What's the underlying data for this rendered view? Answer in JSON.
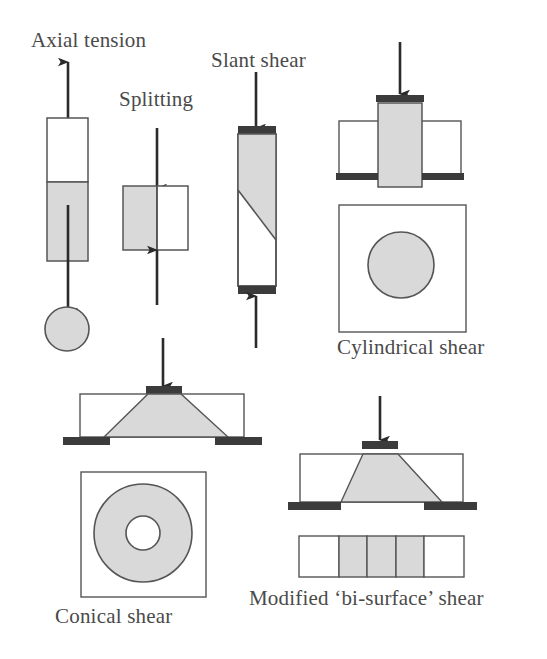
{
  "figure": {
    "background_color": "#ffffff",
    "line_color": "#555555",
    "shade_color": "#d9d9d9",
    "plate_color": "#3b3b3b",
    "text_color": "#4a4a4a",
    "arrow_color": "#2b2b2b"
  },
  "labels": {
    "axial_tension": "Axial tension",
    "splitting": "Splitting",
    "slant_shear": "Slant shear",
    "cylindrical_shear": "Cylindrical shear",
    "conical_shear": "Conical shear",
    "bi_surface_shear": "Modified ‘bi-surface’ shear"
  },
  "diagrams": [
    {
      "id": "axial-tension",
      "label": "Axial tension",
      "elements": [
        "up-arrow",
        "specimen-rectangle-white-top",
        "specimen-rectangle-shaded-bottom",
        "down-arrow",
        "plan-view-circle-shaded"
      ]
    },
    {
      "id": "splitting",
      "label": "Splitting",
      "elements": [
        "down-arrow",
        "specimen-square-shaded-left-half",
        "specimen-square-white-right-half",
        "up-arrow"
      ]
    },
    {
      "id": "slant-shear",
      "label": "Slant shear",
      "elements": [
        "down-arrow",
        "top-bearing-plate",
        "prism-with-diagonal-interface",
        "shaded-upper-portion",
        "bottom-bearing-plate",
        "up-arrow"
      ]
    },
    {
      "id": "cylindrical-shear",
      "label": "Cylindrical shear",
      "elements": [
        "down-arrow",
        "top-bearing-plate",
        "central-shaded-column",
        "left-white-block",
        "right-white-block",
        "left-support-plate",
        "right-support-plate",
        "plan-view-square",
        "plan-view-circle-shaded"
      ]
    },
    {
      "id": "conical-shear",
      "label": "Conical shear",
      "elements": [
        "down-arrow",
        "top-bearing-plate",
        "specimen-block-outline",
        "shaded-cone-trapezoid",
        "left-support-plate",
        "right-support-plate",
        "plan-view-square",
        "plan-view-outer-circle-shaded",
        "plan-view-inner-circle-white"
      ]
    },
    {
      "id": "bi-surface-shear",
      "label": "Modified ‘bi-surface’ shear",
      "elements": [
        "down-arrow",
        "top-bearing-plate",
        "specimen-block-outline",
        "shaded-cone-trapezoid",
        "left-support-plate",
        "right-support-plate",
        "plan-view-strip-five-panels",
        "plan-panel-white-1",
        "plan-panel-shaded-2",
        "plan-panel-shaded-3",
        "plan-panel-shaded-4",
        "plan-panel-white-5"
      ]
    }
  ]
}
